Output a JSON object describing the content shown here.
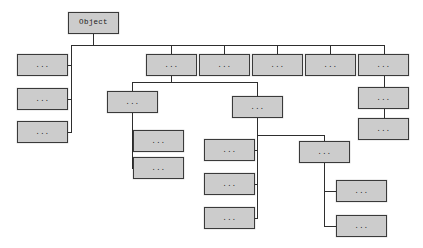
{
  "diagram": {
    "type": "tree",
    "colors": {
      "node_fill": "#cccccc",
      "node_border": "#3a3a3a",
      "edge": "#2e2e2e",
      "background": "#ffffff",
      "text": "#1a1a1a"
    },
    "placeholder_label": "...",
    "root_label": "Object",
    "nodes": [
      {
        "id": "root",
        "label": "Object",
        "x": 68,
        "y": 12,
        "w": 51,
        "h": 22
      },
      {
        "id": "l1",
        "label": "...",
        "x": 17,
        "y": 54,
        "w": 51,
        "h": 22
      },
      {
        "id": "l2",
        "label": "...",
        "x": 17,
        "y": 88,
        "w": 51,
        "h": 22
      },
      {
        "id": "l3",
        "label": "...",
        "x": 17,
        "y": 121,
        "w": 51,
        "h": 22
      },
      {
        "id": "t1",
        "label": "...",
        "x": 146,
        "y": 54,
        "w": 51,
        "h": 22
      },
      {
        "id": "t2",
        "label": "...",
        "x": 199,
        "y": 54,
        "w": 51,
        "h": 22
      },
      {
        "id": "t3",
        "label": "...",
        "x": 252,
        "y": 54,
        "w": 51,
        "h": 22
      },
      {
        "id": "t4",
        "label": "...",
        "x": 305,
        "y": 54,
        "w": 51,
        "h": 22
      },
      {
        "id": "t5",
        "label": "...",
        "x": 358,
        "y": 54,
        "w": 51,
        "h": 22
      },
      {
        "id": "r2",
        "label": "...",
        "x": 358,
        "y": 87,
        "w": 51,
        "h": 22
      },
      {
        "id": "r3",
        "label": "...",
        "x": 358,
        "y": 118,
        "w": 51,
        "h": 22
      },
      {
        "id": "m1",
        "label": "...",
        "x": 107,
        "y": 91,
        "w": 51,
        "h": 22
      },
      {
        "id": "m1a",
        "label": "...",
        "x": 133,
        "y": 130,
        "w": 51,
        "h": 22
      },
      {
        "id": "m1b",
        "label": "...",
        "x": 133,
        "y": 157,
        "w": 51,
        "h": 22
      },
      {
        "id": "m2",
        "label": "...",
        "x": 232,
        "y": 96,
        "w": 51,
        "h": 22
      },
      {
        "id": "m2a",
        "label": "...",
        "x": 204,
        "y": 139,
        "w": 51,
        "h": 22
      },
      {
        "id": "m2b",
        "label": "...",
        "x": 204,
        "y": 173,
        "w": 51,
        "h": 22
      },
      {
        "id": "m2c",
        "label": "...",
        "x": 204,
        "y": 207,
        "w": 51,
        "h": 22
      },
      {
        "id": "m3",
        "label": "...",
        "x": 299,
        "y": 141,
        "w": 51,
        "h": 22
      },
      {
        "id": "m3a",
        "label": "...",
        "x": 336,
        "y": 180,
        "w": 51,
        "h": 22
      },
      {
        "id": "m3b",
        "label": "...",
        "x": 336,
        "y": 215,
        "w": 51,
        "h": 22
      }
    ],
    "edges": [
      {
        "id": "e-root-stem",
        "o": "v",
        "x": 93,
        "y": 34,
        "len": 12
      },
      {
        "id": "e-main-bus",
        "o": "h",
        "x": 71,
        "y": 45,
        "len": 313
      },
      {
        "id": "e-left-trunk",
        "o": "v",
        "x": 71,
        "y": 45,
        "len": 87
      },
      {
        "id": "e-l1",
        "o": "h",
        "x": 68,
        "y": 65,
        "len": 4
      },
      {
        "id": "e-l2",
        "o": "h",
        "x": 68,
        "y": 99,
        "len": 4
      },
      {
        "id": "e-l3",
        "o": "h",
        "x": 68,
        "y": 132,
        "len": 4
      },
      {
        "id": "e-t1-stem",
        "o": "v",
        "x": 171,
        "y": 45,
        "len": 9
      },
      {
        "id": "e-t2-stem",
        "o": "v",
        "x": 224,
        "y": 45,
        "len": 9
      },
      {
        "id": "e-t3-stem",
        "o": "v",
        "x": 277,
        "y": 45,
        "len": 9
      },
      {
        "id": "e-t4-stem",
        "o": "v",
        "x": 330,
        "y": 45,
        "len": 9
      },
      {
        "id": "e-t5-stem",
        "o": "v",
        "x": 384,
        "y": 45,
        "len": 9
      },
      {
        "id": "e-r1-r2",
        "o": "v",
        "x": 384,
        "y": 76,
        "len": 11
      },
      {
        "id": "e-r2-r3",
        "o": "v",
        "x": 384,
        "y": 109,
        "len": 9
      },
      {
        "id": "e-t1-down",
        "o": "v",
        "x": 171,
        "y": 76,
        "len": 7
      },
      {
        "id": "e-t1-bus",
        "o": "h",
        "x": 132,
        "y": 82,
        "len": 126
      },
      {
        "id": "e-m1-stem",
        "o": "v",
        "x": 132,
        "y": 82,
        "len": 9
      },
      {
        "id": "e-m2-stem",
        "o": "v",
        "x": 257,
        "y": 82,
        "len": 14
      },
      {
        "id": "e-m1-down",
        "o": "v",
        "x": 132,
        "y": 113,
        "len": 55
      },
      {
        "id": "e-m1a",
        "o": "h",
        "x": 132,
        "y": 141,
        "len": 2
      },
      {
        "id": "e-m1b",
        "o": "h",
        "x": 132,
        "y": 168,
        "len": 2
      },
      {
        "id": "e-m2-down",
        "o": "v",
        "x": 257,
        "y": 118,
        "len": 18
      },
      {
        "id": "e-m2-bus",
        "o": "h",
        "x": 257,
        "y": 135,
        "len": 68
      },
      {
        "id": "e-m2col-down",
        "o": "v",
        "x": 257,
        "y": 135,
        "len": 84
      },
      {
        "id": "e-m2a",
        "o": "h",
        "x": 255,
        "y": 150,
        "len": 3
      },
      {
        "id": "e-m2b",
        "o": "h",
        "x": 255,
        "y": 184,
        "len": 3
      },
      {
        "id": "e-m2c",
        "o": "h",
        "x": 255,
        "y": 218,
        "len": 3
      },
      {
        "id": "e-m3-stem",
        "o": "v",
        "x": 324,
        "y": 135,
        "len": 7
      },
      {
        "id": "e-m3-down",
        "o": "v",
        "x": 324,
        "y": 163,
        "len": 64
      },
      {
        "id": "e-m3a",
        "o": "h",
        "x": 324,
        "y": 191,
        "len": 13
      },
      {
        "id": "e-m3b",
        "o": "h",
        "x": 324,
        "y": 226,
        "len": 13
      }
    ]
  }
}
